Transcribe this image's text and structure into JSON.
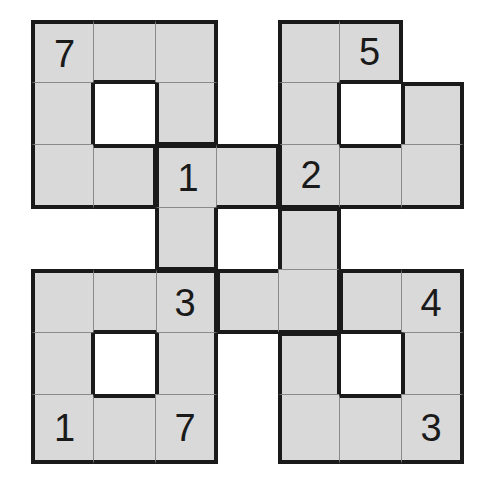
{
  "puzzle": {
    "rows": 7,
    "cols": 7,
    "cell_color": "#d9d9d9",
    "border_color": "#1a1a1a",
    "cells": [
      {
        "r": 0,
        "c": 0,
        "region": "A",
        "value": "7"
      },
      {
        "r": 0,
        "c": 1,
        "region": "A",
        "value": ""
      },
      {
        "r": 0,
        "c": 2,
        "region": "A",
        "value": ""
      },
      {
        "r": 1,
        "c": 0,
        "region": "A",
        "value": ""
      },
      {
        "r": 1,
        "c": 2,
        "region": "A",
        "value": ""
      },
      {
        "r": 2,
        "c": 0,
        "region": "A",
        "value": ""
      },
      {
        "r": 2,
        "c": 1,
        "region": "A",
        "value": ""
      },
      {
        "r": 0,
        "c": 4,
        "region": "B",
        "value": ""
      },
      {
        "r": 0,
        "c": 5,
        "region": "B",
        "value": "5"
      },
      {
        "r": 1,
        "c": 4,
        "region": "B",
        "value": ""
      },
      {
        "r": 1,
        "c": 6,
        "region": "B",
        "value": ""
      },
      {
        "r": 2,
        "c": 4,
        "region": "B",
        "value": "2"
      },
      {
        "r": 2,
        "c": 5,
        "region": "B",
        "value": ""
      },
      {
        "r": 2,
        "c": 6,
        "region": "B",
        "value": ""
      },
      {
        "r": 2,
        "c": 2,
        "region": "C",
        "value": "1"
      },
      {
        "r": 2,
        "c": 3,
        "region": "C",
        "value": ""
      },
      {
        "r": 3,
        "c": 2,
        "region": "C",
        "value": ""
      },
      {
        "r": 3,
        "c": 4,
        "region": "C",
        "value": ""
      },
      {
        "r": 4,
        "c": 2,
        "region": "D",
        "value": "3"
      },
      {
        "r": 4,
        "c": 3,
        "region": "C",
        "value": ""
      },
      {
        "r": 4,
        "c": 4,
        "region": "C",
        "value": ""
      },
      {
        "r": 4,
        "c": 0,
        "region": "D",
        "value": ""
      },
      {
        "r": 4,
        "c": 1,
        "region": "D",
        "value": ""
      },
      {
        "r": 5,
        "c": 0,
        "region": "D",
        "value": ""
      },
      {
        "r": 5,
        "c": 2,
        "region": "D",
        "value": ""
      },
      {
        "r": 6,
        "c": 0,
        "region": "D",
        "value": "1"
      },
      {
        "r": 6,
        "c": 1,
        "region": "D",
        "value": ""
      },
      {
        "r": 6,
        "c": 2,
        "region": "D",
        "value": "7"
      },
      {
        "r": 4,
        "c": 5,
        "region": "E",
        "value": ""
      },
      {
        "r": 4,
        "c": 6,
        "region": "E",
        "value": "4"
      },
      {
        "r": 5,
        "c": 4,
        "region": "E",
        "value": ""
      },
      {
        "r": 5,
        "c": 6,
        "region": "E",
        "value": ""
      },
      {
        "r": 6,
        "c": 4,
        "region": "E",
        "value": ""
      },
      {
        "r": 6,
        "c": 5,
        "region": "E",
        "value": ""
      },
      {
        "r": 6,
        "c": 6,
        "region": "E",
        "value": "3"
      }
    ]
  }
}
